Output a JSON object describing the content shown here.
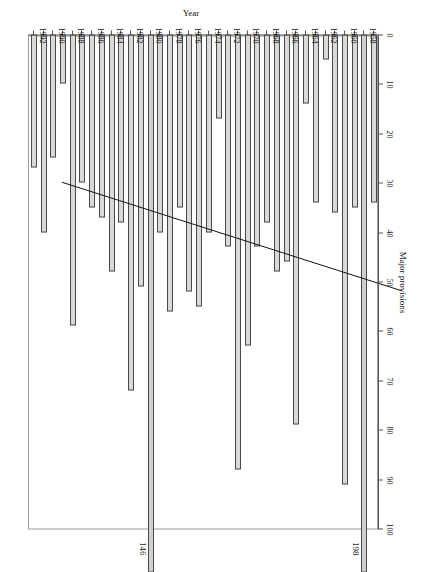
{
  "chart_data": {
    "type": "bar",
    "orientation": "horizontal",
    "title": "",
    "xlabel": "Major provisions",
    "ylabel": "Year",
    "xlim": [
      0,
      100
    ],
    "x_reversed": true,
    "grid": false,
    "legend": null,
    "xticks": [
      100,
      90,
      80,
      70,
      60,
      50,
      40,
      30,
      20,
      10,
      0
    ],
    "categories": [
      "1958",
      "1959",
      "1960",
      "1961",
      "1962",
      "1963",
      "1964",
      "1965",
      "1966",
      "1967",
      "1968",
      "1969",
      "1970",
      "1971",
      "1972",
      "1973",
      "1974",
      "1975",
      "1976",
      "1977",
      "1978",
      "1979",
      "1980",
      "1981",
      "1982",
      "1983",
      "1984",
      "1985",
      "1986",
      "1987",
      "1988",
      "1989",
      "1990",
      "1991",
      "1992",
      "1993"
    ],
    "category_tick_labels": [
      "1958",
      "1960",
      "1962",
      "1964",
      "1966",
      "1968",
      "1970",
      "1972",
      "1974",
      "1976",
      "1978",
      "1980",
      "1982",
      "1984",
      "1986",
      "1988",
      "1990",
      "1992"
    ],
    "values": [
      34,
      198,
      35,
      91,
      36,
      5,
      34,
      14,
      79,
      46,
      48,
      38,
      43,
      63,
      88,
      43,
      17,
      40,
      55,
      52,
      35,
      56,
      40,
      146,
      51,
      72,
      38,
      48,
      37,
      35,
      30,
      59,
      10,
      25,
      40,
      27
    ],
    "annotations": [
      {
        "label": "198",
        "category": "1959",
        "value": 198
      },
      {
        "label": "146",
        "category": "1981",
        "value": 146
      }
    ],
    "trendline": {
      "present": true,
      "start": {
        "category": "1958",
        "value": 60
      },
      "end": {
        "category": "1993",
        "value": 38
      },
      "style": "solid-thin-black"
    },
    "colors": {
      "bar_fill": "#d9d9d9",
      "bar_stroke": "#4a4a4a",
      "axis": "#555555",
      "text": "#1a1a1a",
      "trendline": "#111111",
      "background": "#ffffff"
    }
  }
}
